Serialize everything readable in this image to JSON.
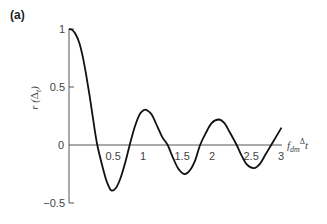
{
  "panel_label": "(a)",
  "chart_data": {
    "type": "line",
    "title": "",
    "panel": "(a)",
    "xlabel": "f_dm Δt",
    "ylabel": "r (Δ_t)",
    "xlim": [
      0,
      3.1
    ],
    "ylim": [
      -0.5,
      1
    ],
    "grid": false,
    "legend": null,
    "x_ticks": [
      "0.5",
      "1",
      "1.5",
      "2",
      "2.5",
      "3"
    ],
    "y_ticks": [
      "1",
      "0.5",
      "0",
      "−0.5"
    ],
    "series": [
      {
        "name": "r(Δt)",
        "x": [
          0.0,
          0.05,
          0.1,
          0.15,
          0.2,
          0.25,
          0.3,
          0.35,
          0.41,
          0.5,
          0.55,
          0.61,
          0.68,
          0.75,
          0.82,
          0.88,
          0.95,
          1.02,
          1.08,
          1.13,
          1.2,
          1.28,
          1.35,
          1.43,
          1.5,
          1.58,
          1.67,
          1.75,
          1.83,
          1.9,
          1.98,
          2.07,
          2.17,
          2.25,
          2.33,
          2.43,
          2.5,
          2.58,
          2.68,
          2.77,
          2.85,
          2.93,
          3.0,
          3.08
        ],
        "y": [
          1.0,
          0.99,
          0.95,
          0.88,
          0.76,
          0.6,
          0.42,
          0.22,
          0.0,
          -0.22,
          -0.32,
          -0.39,
          -0.37,
          -0.28,
          -0.14,
          0.0,
          0.15,
          0.26,
          0.3,
          0.3,
          0.26,
          0.16,
          0.07,
          0.0,
          -0.1,
          -0.2,
          -0.25,
          -0.22,
          -0.13,
          0.0,
          0.1,
          0.19,
          0.22,
          0.19,
          0.11,
          0.0,
          -0.09,
          -0.17,
          -0.2,
          -0.16,
          -0.08,
          0.0,
          0.07,
          0.15
        ]
      }
    ],
    "annotations": []
  }
}
